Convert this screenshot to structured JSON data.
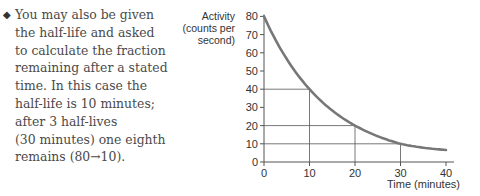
{
  "text": {
    "bullet": "◆",
    "lines": [
      "You may also be given",
      "the half-life and asked",
      "to calculate the fraction",
      "remaining after a stated",
      "time. In this case the",
      "half-life is 10 minutes;",
      "after 3 half-lives",
      "(30 minutes) one eighth",
      "remains (80→10)."
    ]
  },
  "chart_data": {
    "type": "line",
    "title": "",
    "xlabel": "Time (minutes)",
    "ylabel": "Activity (counts per second)",
    "ylabel_lines": [
      "Activity",
      "(counts per",
      "second)"
    ],
    "x": [
      0,
      10,
      20,
      30,
      40
    ],
    "series": [
      {
        "name": "Activity",
        "values": [
          80,
          40,
          20,
          10,
          5
        ],
        "color": "#777777"
      }
    ],
    "xticks": [
      "0",
      "10",
      "20",
      "30",
      "40"
    ],
    "yticks": [
      "0",
      "10",
      "20",
      "30",
      "40",
      "50",
      "60",
      "70",
      "80"
    ],
    "xlim": [
      0,
      40
    ],
    "ylim": [
      0,
      80
    ],
    "grid": false,
    "guide_lines": [
      {
        "from": [
          0,
          40
        ],
        "to": [
          10,
          40
        ],
        "drop_to": [
          10,
          0
        ]
      },
      {
        "from": [
          0,
          20
        ],
        "to": [
          20,
          20
        ],
        "drop_to": [
          20,
          0
        ]
      },
      {
        "from": [
          0,
          10
        ],
        "to": [
          30,
          10
        ],
        "drop_to": [
          30,
          0
        ]
      }
    ],
    "half_life_minutes": 10
  }
}
